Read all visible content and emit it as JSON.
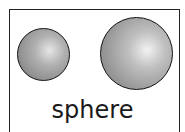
{
  "figure": {
    "label": "sphere",
    "shapes": [
      {
        "name": "small-sphere"
      },
      {
        "name": "large-sphere"
      }
    ]
  }
}
